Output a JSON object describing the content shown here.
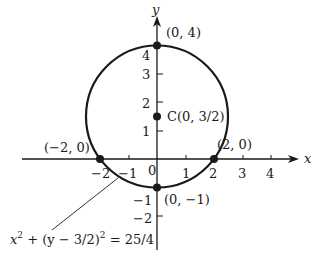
{
  "figure": {
    "axes": {
      "x_label": "x",
      "y_label": "y",
      "x_ticks": [
        {
          "value": -2,
          "label": "−2"
        },
        {
          "value": -1,
          "label": "−1"
        },
        {
          "value": 0,
          "label": "0"
        },
        {
          "value": 1,
          "label": "1"
        },
        {
          "value": 2,
          "label": "2"
        },
        {
          "value": 3,
          "label": "3"
        },
        {
          "value": 4,
          "label": "4"
        }
      ],
      "y_ticks": [
        {
          "value": -2,
          "label": "−2"
        },
        {
          "value": -1,
          "label": "−1"
        },
        {
          "value": 1,
          "label": "1"
        },
        {
          "value": 2,
          "label": "2"
        },
        {
          "value": 3,
          "label": "3"
        },
        {
          "value": 4,
          "label": "4"
        }
      ]
    },
    "circle": {
      "center": [
        0,
        1.5
      ],
      "radius": 2.5,
      "equation": "x² + (y − 3/2)² = 25/4"
    },
    "points": [
      {
        "x": 0,
        "y": 4,
        "label": "(0, 4)"
      },
      {
        "x": 0,
        "y": 1.5,
        "label": "C(0, 3/2)"
      },
      {
        "x": 2,
        "y": 0,
        "label": "(2, 0)"
      },
      {
        "x": -2,
        "y": 0,
        "label": "(−2, 0)"
      },
      {
        "x": 0,
        "y": -1,
        "label": "(0, −1)"
      }
    ],
    "equation_label": {
      "base_x": "x",
      "sup1": "2",
      "mid": " + (y − 3/2)",
      "sup2": "2",
      "rhs": " = 25/4"
    },
    "colors": {
      "ink": "#1a1a1a",
      "background": "#ffffff"
    }
  }
}
